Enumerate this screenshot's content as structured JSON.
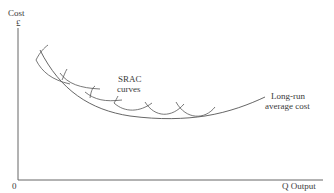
{
  "diagram": {
    "y_axis": {
      "label": "Cost",
      "unit": "£"
    },
    "x_axis": {
      "label": "Q Output",
      "origin": "0"
    },
    "labels": {
      "srac_line1": "SRAC",
      "srac_line2": "curves",
      "lrac_line1": "Long-run",
      "lrac_line2": "average cost"
    },
    "curves": {
      "lrac": {
        "name": "Long-run average cost",
        "shape": "U-shaped envelope"
      },
      "srac": {
        "name": "SRAC curves",
        "count": 6
      }
    },
    "colors": {
      "line": "#555555",
      "text": "#3a3a3a",
      "background": "#ffffff"
    }
  }
}
